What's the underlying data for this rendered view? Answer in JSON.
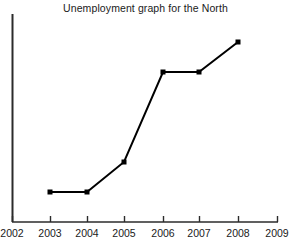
{
  "chart_data": {
    "type": "line",
    "title": "Unemployment graph for the North",
    "xlabel": "",
    "ylabel": "",
    "grid": false,
    "legend": null,
    "axis_color": "#222222",
    "series_color": "#000000",
    "marker": "square",
    "xlim": [
      2002,
      2009
    ],
    "xticks": [
      "2002",
      "2003",
      "2004",
      "2005",
      "2006",
      "2007",
      "2008",
      "2009"
    ],
    "yticks": [],
    "x": [
      2003,
      2004,
      2005,
      2006,
      2007,
      2008
    ],
    "categories": [
      "2003",
      "2004",
      "2005",
      "2006",
      "2007",
      "2008"
    ],
    "values": [
      1.0,
      1.0,
      1.6,
      3.5,
      3.5,
      4.1
    ],
    "series": [
      {
        "name": "Unemployment",
        "values": [
          1.0,
          1.0,
          1.6,
          3.5,
          3.5,
          4.1
        ]
      }
    ],
    "points_px": [
      {
        "year": "2003",
        "x": 50,
        "y": 192
      },
      {
        "year": "2004",
        "x": 87,
        "y": 192
      },
      {
        "year": "2005",
        "x": 124,
        "y": 162
      },
      {
        "year": "2006",
        "x": 163,
        "y": 72
      },
      {
        "year": "2007",
        "x": 199,
        "y": 72
      },
      {
        "year": "2008",
        "x": 238,
        "y": 42
      }
    ],
    "tick_px": [
      12,
      50,
      87,
      124,
      163,
      199,
      238,
      277
    ]
  },
  "axes": {
    "y_axis_top": 14,
    "y_axis_bottom": 222,
    "y_axis_x": 12,
    "x_axis_y": 222,
    "x_axis_left": 12,
    "x_axis_right": 278
  }
}
